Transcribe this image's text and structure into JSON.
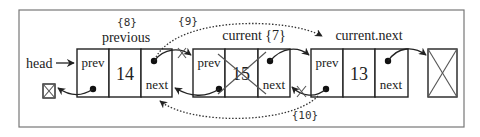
{
  "diagram": {
    "head_label": "head",
    "nodes": [
      {
        "id": "previous",
        "label": "previous",
        "step": "{8}",
        "prev_label": "prev",
        "value": "14",
        "next_label": "next",
        "removed": false
      },
      {
        "id": "current",
        "label": "current {7}",
        "prev_label": "prev",
        "value": "15",
        "next_label": "next",
        "removed": true
      },
      {
        "id": "current-next",
        "label": "current.next",
        "prev_label": "prev",
        "value": "13",
        "next_label": "next",
        "removed": false
      }
    ],
    "steps": {
      "step9": "{9}",
      "step10": "{10}"
    }
  }
}
